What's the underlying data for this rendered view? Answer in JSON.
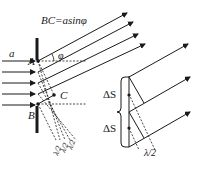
{
  "diagram": {
    "title_formula": "BC=asinφ",
    "labels": {
      "slit_width": "a",
      "point_a": "A",
      "point_b": "B",
      "point_c": "C",
      "angle": "φ",
      "zone_1": "ΔS",
      "zone_2": "ΔS",
      "half_wave": "λ/2",
      "half_wave_marks": [
        "λ/2",
        "λ/2",
        "λ/2"
      ]
    },
    "colors": {
      "line": "#1a1a1a",
      "background": "#ffffff"
    }
  }
}
